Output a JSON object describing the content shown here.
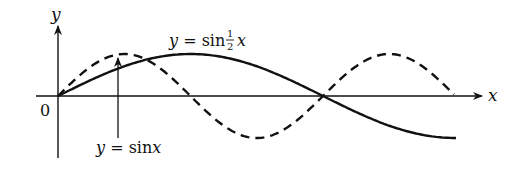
{
  "diagram": {
    "axes": {
      "x_label": "x",
      "y_label": "y",
      "origin_label": "0"
    },
    "curves": [
      {
        "name": "sin-half-x",
        "label_prefix": "y = sin",
        "frac_num": "1",
        "frac_den": "2",
        "label_suffix": "x",
        "style": "solid"
      },
      {
        "name": "sin-x",
        "label": "y = sin x",
        "style": "dashed"
      }
    ]
  },
  "colors": {
    "ink": "#111111",
    "background": "#ffffff"
  }
}
